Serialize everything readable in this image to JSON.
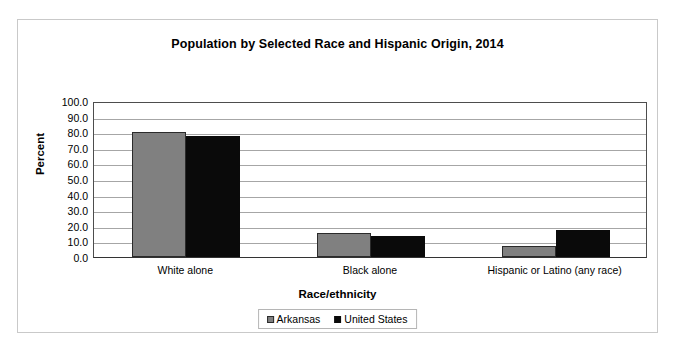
{
  "chart_data": {
    "type": "bar",
    "title": "Population by Selected Race and Hispanic Origin, 2014",
    "xlabel": "Race/ethnicity",
    "ylabel": "Percent",
    "categories": [
      "White alone",
      "Black alone",
      "Hispanic or Latino (any race)"
    ],
    "series": [
      {
        "name": "Arkansas",
        "color": "#808080",
        "values": [
          80.1,
          15.7,
          7.0
        ]
      },
      {
        "name": "United States",
        "color": "#0a0a0a",
        "values": [
          77.4,
          13.2,
          17.4
        ]
      }
    ],
    "ylim": [
      0,
      100
    ],
    "yticks": [
      "100.0",
      "90.0",
      "80.0",
      "70.0",
      "60.0",
      "50.0",
      "40.0",
      "30.0",
      "20.0",
      "10.0",
      "0.0"
    ],
    "ytick_values": [
      100,
      90,
      80,
      70,
      60,
      50,
      40,
      30,
      20,
      10,
      0
    ],
    "grid": true,
    "legend_position": "bottom"
  }
}
